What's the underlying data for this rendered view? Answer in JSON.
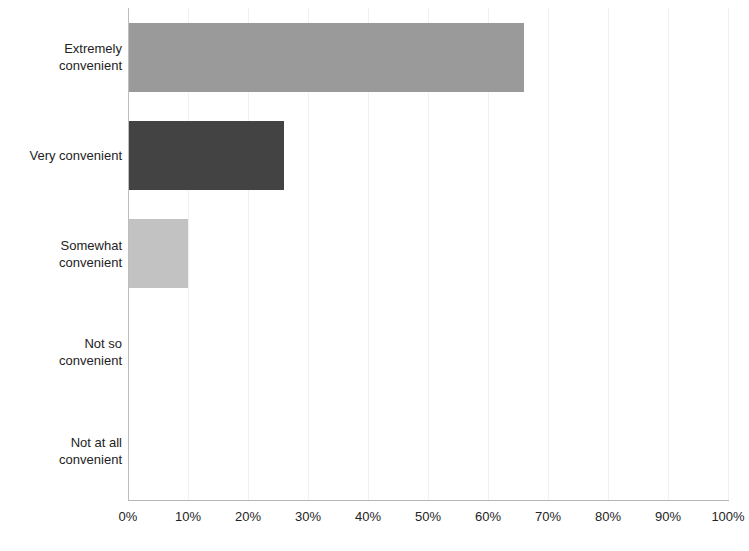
{
  "chart_data": {
    "type": "bar",
    "orientation": "horizontal",
    "title": "",
    "subtitle": "",
    "xlabel": "",
    "ylabel": "",
    "categories": [
      "Extremely convenient",
      "Very convenient",
      "Somewhat convenient",
      "Not so convenient",
      "Not at all convenient"
    ],
    "category_lines": [
      [
        "Extremely",
        "convenient"
      ],
      [
        "Very convenient"
      ],
      [
        "Somewhat",
        "convenient"
      ],
      [
        "Not so",
        "convenient"
      ],
      [
        "Not at all",
        "convenient"
      ]
    ],
    "values": [
      66,
      26,
      10,
      0,
      0
    ],
    "value_labels": [
      "66%",
      "26%",
      "10%",
      "0%",
      "0%"
    ],
    "bar_colors": [
      "#9a9a9a",
      "#434343",
      "#c2c2c2",
      "#c2c2c2",
      "#c2c2c2"
    ],
    "xlim": [
      0,
      100
    ],
    "xticks": [
      0,
      10,
      20,
      30,
      40,
      50,
      60,
      70,
      80,
      90,
      100
    ],
    "xtick_labels": [
      "0%",
      "10%",
      "20%",
      "30%",
      "40%",
      "50%",
      "60%",
      "70%",
      "80%",
      "90%",
      "100%"
    ],
    "grid": true,
    "grid_color": "#f0f0f0",
    "axis_color": "#bdbdbd",
    "legend": null,
    "legend_position": "none",
    "background_color": "#ffffff",
    "text_color": "#232323",
    "annotations": []
  }
}
